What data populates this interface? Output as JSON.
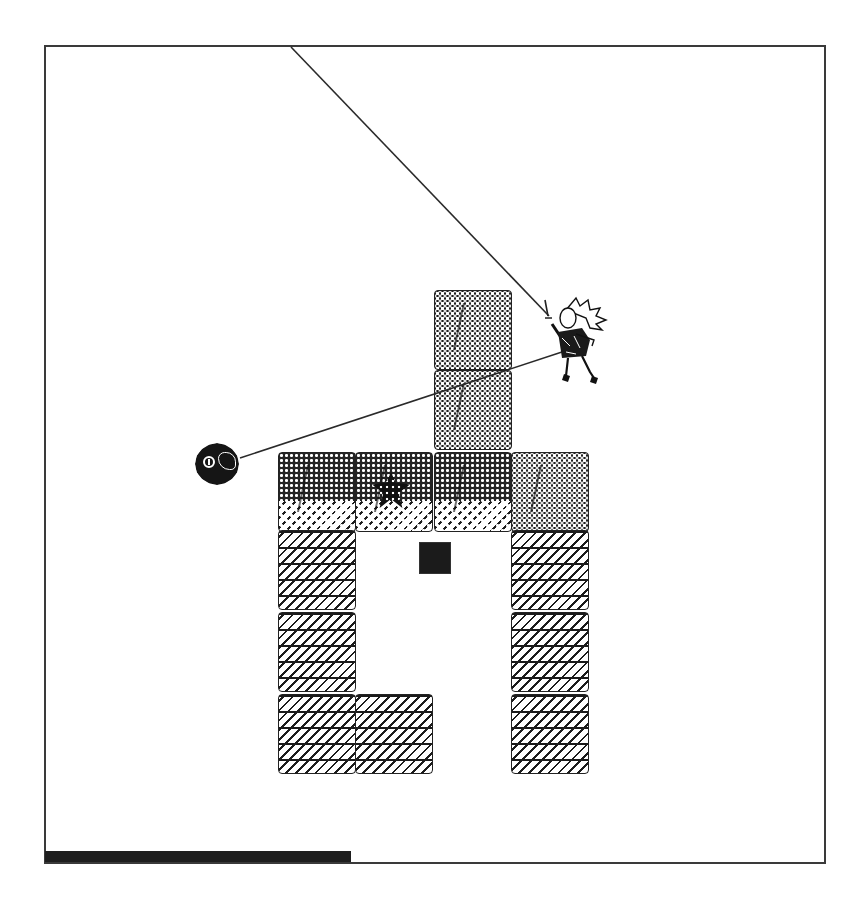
{
  "game": {
    "view": "side-scrolling-platformer",
    "palette": {
      "background": "#ffffff",
      "ink": "#1e1e1e",
      "frame": "#3a3a3a"
    }
  },
  "playfield": {
    "frame": {
      "x": 44,
      "y": 45,
      "width": 782,
      "height": 819
    }
  },
  "tiles": [
    {
      "id": "tower-top",
      "type": "stone",
      "x": 434,
      "y": 290
    },
    {
      "id": "tower-mid",
      "type": "stone",
      "x": 434,
      "y": 370
    },
    {
      "id": "row-a",
      "type": "mixed",
      "x": 278,
      "y": 452
    },
    {
      "id": "row-b-gem",
      "type": "mixed",
      "x": 355,
      "y": 452
    },
    {
      "id": "row-c",
      "type": "mixed",
      "x": 434,
      "y": 452
    },
    {
      "id": "row-d",
      "type": "stone",
      "x": 511,
      "y": 452
    },
    {
      "id": "left-col-1",
      "type": "brick",
      "x": 278,
      "y": 530
    },
    {
      "id": "left-col-2",
      "type": "brick",
      "x": 278,
      "y": 612
    },
    {
      "id": "left-col-3",
      "type": "brick",
      "x": 278,
      "y": 694
    },
    {
      "id": "bottom-mid",
      "type": "brick",
      "x": 355,
      "y": 694
    },
    {
      "id": "right-col-1",
      "type": "brick",
      "x": 511,
      "y": 530
    },
    {
      "id": "right-col-2",
      "type": "brick",
      "x": 511,
      "y": 612
    },
    {
      "id": "right-col-3",
      "type": "brick",
      "x": 511,
      "y": 694
    }
  ],
  "entities": {
    "player": {
      "name": "spiky-haired warrior",
      "x": 546,
      "y": 296
    },
    "enemy_orb": {
      "name": "dark orb",
      "x": 195,
      "y": 443
    },
    "gem": {
      "name": "dark star gem",
      "x": 372,
      "y": 472
    },
    "dark_block": {
      "name": "dark square",
      "x": 419,
      "y": 542,
      "size": 32
    }
  },
  "lines": [
    {
      "name": "grapple-line-top",
      "x1": 291,
      "y1": 47,
      "x2": 549,
      "y2": 316
    },
    {
      "name": "tether-line-orb",
      "x1": 240,
      "y1": 458,
      "x2": 568,
      "y2": 350
    }
  ],
  "hud": {
    "health_bar": {
      "fill_width": 306,
      "max_width": 781,
      "color": "#1e1e1e"
    }
  }
}
